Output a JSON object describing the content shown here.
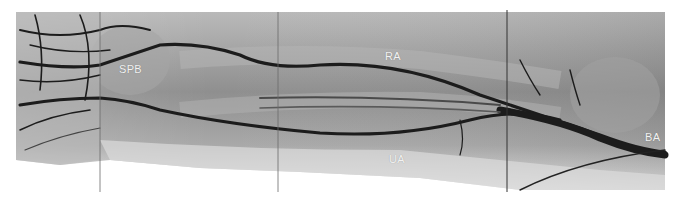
{
  "image": {
    "description": "Upper-extremity angiogram of forearm showing arterial anatomy",
    "background": "#ffffff",
    "tissue_color": "#9a9a9a",
    "vessel_color": "#1a1a1a"
  },
  "labels": [
    {
      "id": "spb",
      "text": "SPB",
      "x": 119,
      "y": 63
    },
    {
      "id": "ra",
      "text": "RA",
      "x": 385,
      "y": 50
    },
    {
      "id": "ua",
      "text": "UA",
      "x": 389,
      "y": 153
    },
    {
      "id": "ba",
      "text": "BA",
      "x": 645,
      "y": 131
    }
  ],
  "stitch_lines": [
    100,
    278,
    507
  ]
}
